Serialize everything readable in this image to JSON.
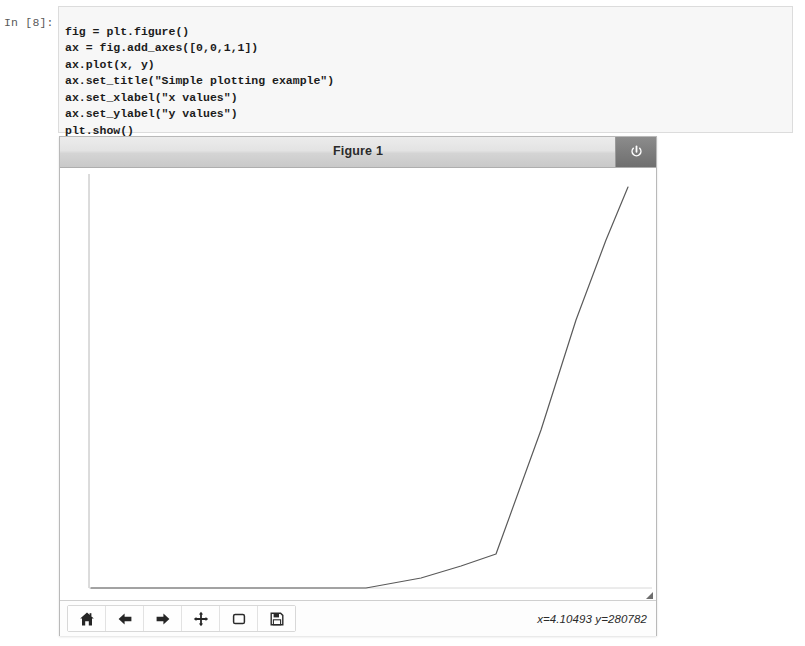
{
  "notebook": {
    "prompt_label": "In [8]:",
    "code_lines": [
      "fig = plt.figure()",
      "ax = fig.add_axes([0,0,1,1])",
      "ax.plot(x, y)",
      "ax.set_title(\"Simple plotting example\")",
      "ax.set_xlabel(\"x values\")",
      "ax.set_ylabel(\"y values\")",
      "plt.show()"
    ],
    "code_text": "fig = plt.figure()\nax = fig.add_axes([0,0,1,1])\nax.plot(x, y)\nax.set_title(\"Simple plotting example\")\nax.set_xlabel(\"x values\")\nax.set_ylabel(\"y values\")\nplt.show()"
  },
  "figure_window": {
    "title": "Figure 1",
    "close_icon": "power-icon",
    "resize_grip_icon": "resize-grip-icon"
  },
  "toolbar": {
    "buttons": [
      {
        "name": "home-button",
        "icon": "home-icon"
      },
      {
        "name": "back-button",
        "icon": "arrow-left-icon"
      },
      {
        "name": "forward-button",
        "icon": "arrow-right-icon"
      },
      {
        "name": "pan-button",
        "icon": "move-cross-icon"
      },
      {
        "name": "zoom-rect-button",
        "icon": "square-icon"
      },
      {
        "name": "save-button",
        "icon": "floppy-disk-icon"
      }
    ],
    "coordinate_readout": "x=4.10493 y=280782",
    "coordinate_x": "4.10493",
    "coordinate_y": "280782"
  },
  "chart_data": {
    "type": "line",
    "title": "",
    "xlabel": "",
    "ylabel": "",
    "grid": false,
    "legend": null,
    "line_color": "#5a5a5a",
    "line_width": 1.2,
    "axes_rect": [
      0,
      0,
      1,
      1
    ],
    "xlim": [
      0,
      5
    ],
    "ylim": [
      0,
      1100000
    ],
    "x": [
      0,
      0.6,
      1.3,
      2.1,
      2.7,
      3.1,
      3.55,
      3.95,
      4.35,
      4.75,
      5.0
    ],
    "y": [
      1200,
      1600,
      2400,
      4200,
      9000,
      22000,
      60000,
      105000,
      430000,
      790000,
      1060000
    ],
    "pixel_vertices": [
      [
        90,
        588
      ],
      [
        190,
        588
      ],
      [
        280,
        588
      ],
      [
        365,
        588
      ],
      [
        420,
        578
      ],
      [
        460,
        566
      ],
      [
        495,
        554
      ],
      [
        540,
        430
      ],
      [
        575,
        320
      ],
      [
        605,
        240
      ],
      [
        627,
        187
      ]
    ],
    "series": [
      {
        "name": "y",
        "values": [
          1200,
          1600,
          2400,
          4200,
          9000,
          22000,
          60000,
          105000,
          430000,
          790000,
          1060000
        ]
      }
    ]
  },
  "colors": {
    "page_background": "#ffffff",
    "code_cell_background": "#f7f7f7",
    "code_cell_border": "#dcdcdc",
    "titlebar_top": "#ececec",
    "titlebar_bottom": "#c9c9c9",
    "close_button": "#7d7d7d",
    "plot_line": "#5a5a5a",
    "axis_line": "#b0b0b0"
  }
}
